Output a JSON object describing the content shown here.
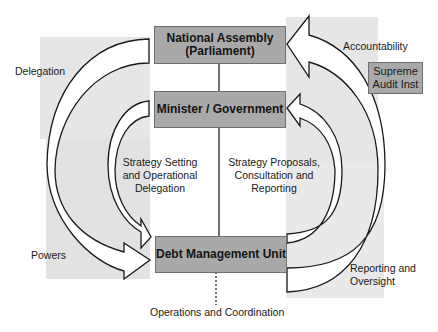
{
  "diagram": {
    "boxes": {
      "national_assembly": {
        "line1": "National Assembly",
        "line2": "(Parliament)"
      },
      "minister": {
        "label": "Minister / Government"
      },
      "debt_management_unit": {
        "label": "Debt Management Unit"
      },
      "supreme_audit": {
        "line1": "Supreme",
        "line2": "Audit Inst"
      }
    },
    "labels": {
      "delegation": "Delegation",
      "powers": "Powers",
      "accountability": "Accountability",
      "strategy_setting": {
        "line1": "Strategy Setting",
        "line2": "and Operational",
        "line3": "Delegation"
      },
      "strategy_proposals": {
        "line1": "Strategy Proposals,",
        "line2": "Consultation and",
        "line3": "Reporting"
      },
      "reporting_oversight": {
        "line1": "Reporting and",
        "line2": "Oversight"
      },
      "operations": "Operations and Coordination"
    },
    "colors": {
      "box_fill": "#a9a9a9",
      "shade": "#e4e4e4",
      "line": "#1a1a1a",
      "arrow_fill": "#ffffff"
    }
  }
}
